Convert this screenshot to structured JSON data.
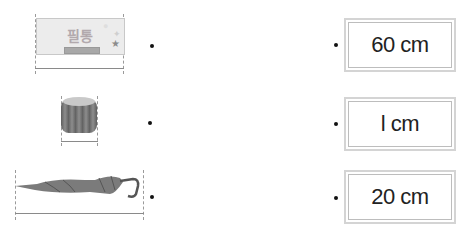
{
  "items": [
    {
      "name": "pencil-case",
      "label": "필통"
    },
    {
      "name": "eraser-cap"
    },
    {
      "name": "umbrella"
    }
  ],
  "answers": [
    {
      "value": "60 cm"
    },
    {
      "value": "l cm"
    },
    {
      "value": "20 cm"
    }
  ],
  "colors": {
    "box_border": "#d4d4d4",
    "dot": "#111111"
  }
}
